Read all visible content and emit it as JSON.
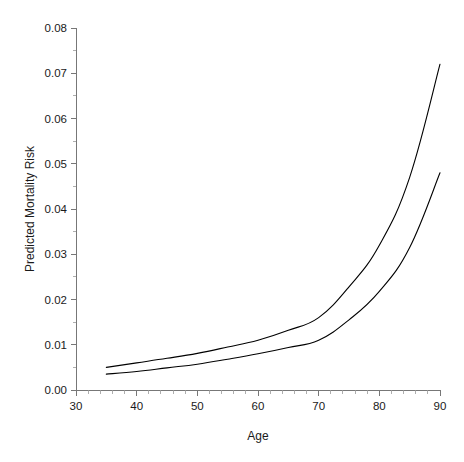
{
  "chart_data": {
    "type": "line",
    "title": "",
    "xlabel": "Age",
    "ylabel": "Predicted Mortality Risk",
    "xlim": [
      30,
      90
    ],
    "ylim": [
      0.0,
      0.08
    ],
    "grid": false,
    "legend": "none",
    "x_ticks": [
      30,
      40,
      50,
      60,
      70,
      80,
      90
    ],
    "x_tick_labels": [
      "30",
      "40",
      "50",
      "60",
      "70",
      "80",
      "90"
    ],
    "x_minor_tick_step": 2,
    "y_ticks": [
      0.0,
      0.01,
      0.02,
      0.03,
      0.04,
      0.05,
      0.06,
      0.07,
      0.08
    ],
    "y_tick_labels": [
      "0.00",
      "0.01",
      "0.02",
      "0.03",
      "0.04",
      "0.05",
      "0.06",
      "0.07",
      "0.08"
    ],
    "series": [
      {
        "name": "upper-curve",
        "color": "#000000",
        "x": [
          35,
          40,
          45,
          50,
          55,
          60,
          65,
          70,
          75,
          80,
          85,
          90
        ],
        "values": [
          0.005,
          0.006,
          0.007,
          0.0081,
          0.0095,
          0.011,
          0.0132,
          0.016,
          0.0228,
          0.032,
          0.047,
          0.072
        ]
      },
      {
        "name": "lower-curve",
        "color": "#000000",
        "x": [
          35,
          40,
          45,
          50,
          55,
          60,
          65,
          70,
          75,
          80,
          85,
          90
        ],
        "values": [
          0.0035,
          0.0041,
          0.0049,
          0.0057,
          0.0068,
          0.008,
          0.0094,
          0.011,
          0.0155,
          0.0218,
          0.0315,
          0.048
        ]
      }
    ]
  },
  "axes": {
    "x_title": "Age",
    "y_title": "Predicted Mortality Risk"
  }
}
